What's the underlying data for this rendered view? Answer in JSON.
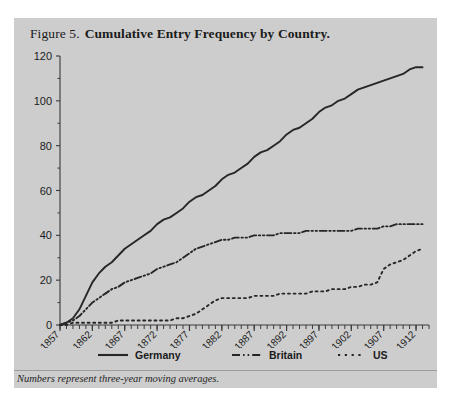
{
  "figure": {
    "number": "Figure 5.",
    "title": "Cumulative Entry Frequency by Country.",
    "note": "Numbers represent three-year moving averages.",
    "panel_color": "#cdcdcd",
    "line_color": "#262626"
  },
  "legend": {
    "germany_label": "Germany",
    "britain_label": "Britain",
    "us_label": "US"
  },
  "chart_data": {
    "type": "line",
    "title": "Cumulative Entry Frequency by Country.",
    "subtitle": "Numbers represent three-year moving averages.",
    "xlabel": "",
    "ylabel": "",
    "xlim": [
      1857,
      1914
    ],
    "ylim": [
      0,
      120
    ],
    "yticks": [
      0,
      20,
      40,
      60,
      80,
      100,
      120
    ],
    "xticks": [
      1857,
      1862,
      1867,
      1872,
      1877,
      1882,
      1887,
      1892,
      1897,
      1902,
      1907,
      1912
    ],
    "xtick_labels": [
      "1857",
      "1862",
      "1867",
      "1872",
      "1877",
      "1882",
      "1887",
      "1892",
      "1897",
      "1902",
      "1907",
      "1912"
    ],
    "ytick_labels": [
      "0",
      "20",
      "40",
      "60",
      "80",
      "100",
      "120"
    ],
    "xtick_rotation": 45,
    "minor_xtick_interval": 1,
    "grid": false,
    "legend_position": "below",
    "x": [
      1857,
      1858,
      1859,
      1860,
      1861,
      1862,
      1863,
      1864,
      1865,
      1866,
      1867,
      1868,
      1869,
      1870,
      1871,
      1872,
      1873,
      1874,
      1875,
      1876,
      1877,
      1878,
      1879,
      1880,
      1881,
      1882,
      1883,
      1884,
      1885,
      1886,
      1887,
      1888,
      1889,
      1890,
      1891,
      1892,
      1893,
      1894,
      1895,
      1896,
      1897,
      1898,
      1899,
      1900,
      1901,
      1902,
      1903,
      1904,
      1905,
      1906,
      1907,
      1908,
      1909,
      1910,
      1911,
      1912,
      1913
    ],
    "series": [
      {
        "name": "Germany",
        "style": "solid",
        "color": "#262626",
        "values": [
          0,
          1,
          3,
          7,
          13,
          19,
          23,
          26,
          28,
          31,
          34,
          36,
          38,
          40,
          42,
          45,
          47,
          48,
          50,
          52,
          55,
          57,
          58,
          60,
          62,
          65,
          67,
          68,
          70,
          72,
          75,
          77,
          78,
          80,
          82,
          85,
          87,
          88,
          90,
          92,
          95,
          97,
          98,
          100,
          101,
          103,
          105,
          106,
          107,
          108,
          109,
          110,
          111,
          112,
          114,
          115,
          115
        ]
      },
      {
        "name": "Britain",
        "style": "dashdot",
        "color": "#262626",
        "values": [
          0,
          1,
          2,
          4,
          7,
          10,
          12,
          14,
          16,
          17,
          19,
          20,
          21,
          22,
          23,
          25,
          26,
          27,
          28,
          30,
          32,
          34,
          35,
          36,
          37,
          38,
          38,
          39,
          39,
          39,
          40,
          40,
          40,
          40,
          41,
          41,
          41,
          41,
          42,
          42,
          42,
          42,
          42,
          42,
          42,
          42,
          43,
          43,
          43,
          43,
          44,
          44,
          45,
          45,
          45,
          45,
          45
        ]
      },
      {
        "name": "US",
        "style": "dotted",
        "color": "#262626",
        "values": [
          0,
          0,
          1,
          1,
          1,
          1,
          1,
          1,
          1,
          2,
          2,
          2,
          2,
          2,
          2,
          2,
          2,
          2,
          3,
          3,
          4,
          5,
          7,
          9,
          11,
          12,
          12,
          12,
          12,
          12,
          13,
          13,
          13,
          13,
          14,
          14,
          14,
          14,
          14,
          15,
          15,
          15,
          16,
          16,
          16,
          17,
          17,
          18,
          18,
          19,
          25,
          27,
          28,
          29,
          31,
          33,
          34
        ]
      }
    ]
  }
}
